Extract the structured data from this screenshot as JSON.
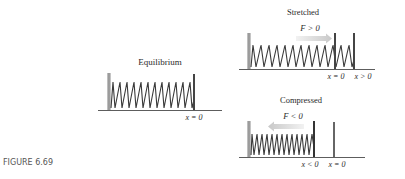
{
  "figure": {
    "caption": "FIGURE 6.69",
    "panels": {
      "equilibrium": {
        "title": "Equilibrium",
        "position_label": "x = 0"
      },
      "stretched": {
        "title": "Stretched",
        "force_label": "F > 0",
        "position_labels": [
          "x = 0",
          "x > 0"
        ]
      },
      "compressed": {
        "title": "Compressed",
        "force_label": "F < 0",
        "position_labels": [
          "x < 0",
          "x = 0"
        ]
      }
    },
    "colors": {
      "spring": "#3a3a3a",
      "wall": "#9a9a9a",
      "plate": "#444444",
      "arrow": "#d6d6d6",
      "baseline": "#333333",
      "caption": "#555555"
    }
  }
}
